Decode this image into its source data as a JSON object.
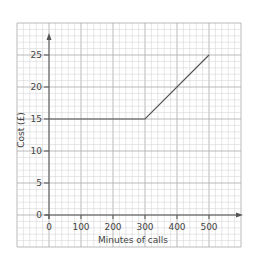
{
  "chart_data": {
    "type": "line",
    "title": "",
    "xlabel": "Minutes of calls",
    "ylabel": "Cost (£)",
    "xlim": [
      0,
      500
    ],
    "ylim": [
      0,
      25
    ],
    "x_ticks": [
      0,
      100,
      200,
      300,
      400,
      500
    ],
    "y_ticks": [
      0,
      5,
      10,
      15,
      20,
      25
    ],
    "grid": true,
    "legend": null,
    "series": [
      {
        "name": "Cost",
        "x": [
          0,
          300,
          500
        ],
        "y": [
          15,
          15,
          25
        ]
      }
    ]
  },
  "colors": {
    "grid_minor": "#cfcfcf",
    "grid_major": "#a8a8a8",
    "axis": "#555555",
    "line": "#555555",
    "text": "#444444"
  }
}
